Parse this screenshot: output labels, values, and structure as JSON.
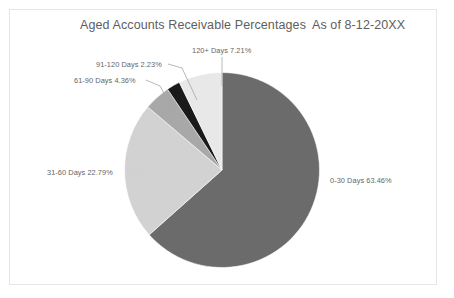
{
  "chart": {
    "title": "Aged Accounts Receivable Percentages",
    "as_of": "As of 8-12-20XX",
    "frame_border_color": "#e6e6e6",
    "background": "#ffffff",
    "title_color": "#5e5e5e",
    "label_color": "#666666"
  },
  "chart_data": {
    "type": "pie",
    "title": "Aged Accounts Receivable Percentages",
    "subtitle": "As of 8-12-20XX",
    "xlabel": "",
    "ylabel": "",
    "legend_position": "none",
    "grid": false,
    "start_angle_deg": 0,
    "direction": "clockwise",
    "units": "percent",
    "categories": [
      "0-30 Days",
      "31-60 Days",
      "61-90 Days",
      "91-120 Days",
      "120+ Days"
    ],
    "values": [
      63.46,
      22.79,
      4.36,
      2.23,
      7.21
    ],
    "colors": [
      "#6b6b6b",
      "#d2d2d2",
      "#a8a8a8",
      "#1a1a1a",
      "#e8e8e8"
    ],
    "slices": [
      {
        "label": "0-30 Days",
        "value": 63.46,
        "label_text": "0-30 Days  63.46%",
        "color": "#6b6b6b",
        "label_position": "right"
      },
      {
        "label": "31-60 Days",
        "value": 22.79,
        "label_text": "31-60 Days 22.79%",
        "color": "#d2d2d2",
        "label_position": "left"
      },
      {
        "label": "61-90 Days",
        "value": 4.36,
        "label_text": "61-90 Days 4.36%",
        "color": "#a8a8a8",
        "label_position": "upper-left"
      },
      {
        "label": "91-120 Days",
        "value": 2.23,
        "label_text": "91-120 Days 2.23%",
        "color": "#1a1a1a",
        "label_position": "upper-left"
      },
      {
        "label": "120+ Days",
        "value": 7.21,
        "label_text": "120+ Days 7.21%",
        "color": "#e8e8e8",
        "label_position": "top"
      }
    ]
  }
}
